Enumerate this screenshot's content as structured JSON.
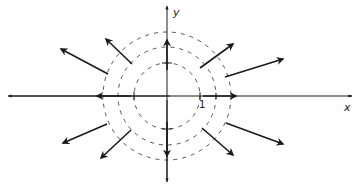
{
  "diagram": {
    "type": "vector-field",
    "axes": {
      "x_label": "x",
      "y_label": "y",
      "tick_label_1": "1"
    },
    "origin_px": [
      167,
      96
    ],
    "unit_px": 33,
    "circles": [
      {
        "radius": 1,
        "style": "dashed"
      },
      {
        "radius": 1.5,
        "style": "dashed"
      },
      {
        "radius": 2,
        "style": "dashed"
      }
    ],
    "vectors": [
      {
        "from": [
          167,
          70
        ],
        "to": [
          167,
          40
        ],
        "direction": "up"
      },
      {
        "from": [
          167,
          122
        ],
        "to": [
          167,
          156
        ],
        "direction": "down"
      },
      {
        "from": [
          131,
          96
        ],
        "to": [
          97,
          96
        ],
        "direction": "left"
      },
      {
        "from": [
          203,
          96
        ],
        "to": [
          236,
          96
        ],
        "direction": "right"
      },
      {
        "from": [
          132,
          64
        ],
        "to": [
          106,
          39
        ],
        "direction": "up-left-inner"
      },
      {
        "from": [
          108,
          74
        ],
        "to": [
          61,
          49
        ],
        "direction": "up-left-outer"
      },
      {
        "from": [
          131,
          130
        ],
        "to": [
          101,
          158
        ],
        "direction": "down-left-inner"
      },
      {
        "from": [
          107,
          124
        ],
        "to": [
          63,
          143
        ],
        "direction": "down-left-outer"
      },
      {
        "from": [
          200,
          68
        ],
        "to": [
          233,
          44
        ],
        "direction": "up-right-inner"
      },
      {
        "from": [
          225,
          77
        ],
        "to": [
          283,
          59
        ],
        "direction": "up-right-outer"
      },
      {
        "from": [
          202,
          128
        ],
        "to": [
          233,
          155
        ],
        "direction": "down-right-inner"
      },
      {
        "from": [
          226,
          123
        ],
        "to": [
          283,
          144
        ],
        "direction": "down-right-outer"
      }
    ],
    "colors": {
      "ink": "#1a1a1a",
      "dash": "#555555",
      "background": "#ffffff"
    }
  }
}
